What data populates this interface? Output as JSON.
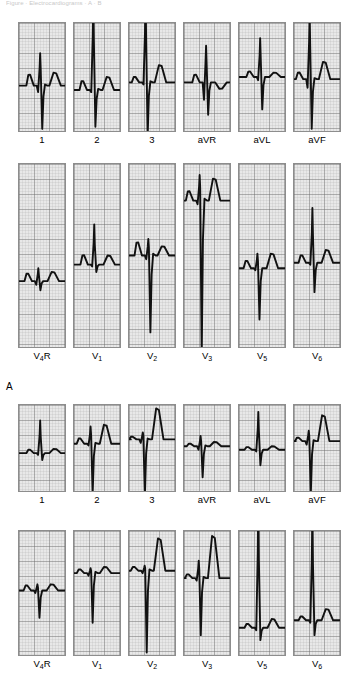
{
  "figure": {
    "cropped_caption": "Figure  ·  Electrocardiograms  ·  A  ·  B",
    "panels": [
      {
        "id": "A",
        "label": "A"
      },
      {
        "id": "B",
        "label": ""
      }
    ]
  },
  "grid": {
    "paper_color": "#e8e8e8",
    "fine_line_color": "#b3b3b3",
    "bold_line_color": "#6e6e6e",
    "border_color": "#8d8d8d",
    "trace_color": "#111111",
    "fine_spacing_px": 3,
    "bold_every": 5
  },
  "rows": [
    {
      "name": "panel-a-limb-leads",
      "panel": "A",
      "top": 22,
      "strip_width": 48,
      "strip_height": 110,
      "gap": 7,
      "left": 18,
      "leads": [
        {
          "label": "1",
          "label_html": "1",
          "name": "lead-i"
        },
        {
          "label": "2",
          "label_html": "2",
          "name": "lead-ii"
        },
        {
          "label": "3",
          "label_html": "3",
          "name": "lead-iii"
        },
        {
          "label": "aVR",
          "label_html": "aVR",
          "name": "lead-avr"
        },
        {
          "label": "aVL",
          "label_html": "aVL",
          "name": "lead-avl"
        },
        {
          "label": "aVF",
          "label_html": "aVF",
          "name": "lead-avf"
        }
      ]
    },
    {
      "name": "panel-a-precordial-leads",
      "panel": "A",
      "top": 163,
      "strip_width": 48,
      "strip_height": 185,
      "gap": 7,
      "left": 18,
      "leads": [
        {
          "label": "V4R",
          "label_html": "V<sub>4</sub>R",
          "name": "lead-v4r"
        },
        {
          "label": "V1",
          "label_html": "V<sub>1</sub>",
          "name": "lead-v1"
        },
        {
          "label": "V2",
          "label_html": "V<sub>2</sub>",
          "name": "lead-v2"
        },
        {
          "label": "V3",
          "label_html": "V<sub>3</sub>",
          "name": "lead-v3"
        },
        {
          "label": "V5",
          "label_html": "V<sub>5</sub>",
          "name": "lead-v5"
        },
        {
          "label": "V6",
          "label_html": "V<sub>6</sub>",
          "name": "lead-v6"
        }
      ]
    },
    {
      "name": "panel-b-limb-leads",
      "panel": "B",
      "top": 404,
      "strip_width": 48,
      "strip_height": 88,
      "gap": 7,
      "left": 18,
      "leads": [
        {
          "label": "1",
          "label_html": "1",
          "name": "lead-i"
        },
        {
          "label": "2",
          "label_html": "2",
          "name": "lead-ii"
        },
        {
          "label": "3",
          "label_html": "3",
          "name": "lead-iii"
        },
        {
          "label": "aVR",
          "label_html": "aVR",
          "name": "lead-avr"
        },
        {
          "label": "aVL",
          "label_html": "aVL",
          "name": "lead-avl"
        },
        {
          "label": "aVF",
          "label_html": "aVF",
          "name": "lead-avf"
        }
      ]
    },
    {
      "name": "panel-b-precordial-leads",
      "panel": "B",
      "top": 530,
      "strip_width": 48,
      "strip_height": 126,
      "gap": 7,
      "left": 18,
      "leads": [
        {
          "label": "V4R",
          "label_html": "V<sub>4</sub>R",
          "name": "lead-v4r"
        },
        {
          "label": "V1",
          "label_html": "V<sub>1</sub>",
          "name": "lead-v1"
        },
        {
          "label": "V2",
          "label_html": "V<sub>2</sub>",
          "name": "lead-v2"
        },
        {
          "label": "V3",
          "label_html": "V<sub>3</sub>",
          "name": "lead-v3"
        },
        {
          "label": "V5",
          "label_html": "V<sub>5</sub>",
          "name": "lead-v5"
        },
        {
          "label": "V6",
          "label_html": "V<sub>6</sub>",
          "name": "lead-v6"
        }
      ]
    }
  ],
  "panel_a_marker": {
    "text": "A",
    "x": 6,
    "y": 381
  },
  "traces": {
    "panel-a-limb-leads": [
      {
        "lead": "1",
        "baseline": 0.58,
        "p": 0.1,
        "q": -0.06,
        "r": 0.3,
        "s": -0.4,
        "t": 0.12,
        "qrs_x": 0.46
      },
      {
        "lead": "2",
        "baseline": 0.62,
        "p": 0.08,
        "q": -0.02,
        "r": 0.92,
        "s": -0.34,
        "t": 0.12,
        "qrs_x": 0.42
      },
      {
        "lead": "3",
        "baseline": 0.55,
        "p": 0.05,
        "q": -0.02,
        "r": 0.85,
        "s": -0.5,
        "t": 0.16,
        "qrs_x": 0.36
      },
      {
        "lead": "aVR",
        "baseline": 0.55,
        "p": 0.07,
        "q": -0.16,
        "r": 0.34,
        "s": -0.3,
        "t": -0.06,
        "qrs_x": 0.48
      },
      {
        "lead": "aVL",
        "baseline": 0.5,
        "p": 0.05,
        "q": -0.03,
        "r": 0.36,
        "s": -0.3,
        "t": 0.04,
        "qrs_x": 0.46
      },
      {
        "lead": "aVF",
        "baseline": 0.52,
        "p": 0.06,
        "q": -0.08,
        "r": 0.62,
        "s": -0.46,
        "t": 0.16,
        "qrs_x": 0.34
      }
    ],
    "panel-a-precordial-leads": [
      {
        "lead": "V4R",
        "baseline": 0.64,
        "p": 0.04,
        "q": -0.02,
        "r": 0.07,
        "s": -0.05,
        "t": 0.05,
        "qrs_x": 0.42
      },
      {
        "lead": "V1",
        "baseline": 0.55,
        "p": 0.05,
        "q": -0.01,
        "r": 0.22,
        "s": -0.04,
        "t": 0.05,
        "qrs_x": 0.44
      },
      {
        "lead": "V2",
        "baseline": 0.5,
        "p": 0.07,
        "q": -0.02,
        "r": 0.09,
        "s": -0.42,
        "t": 0.05,
        "qrs_x": 0.42
      },
      {
        "lead": "V3",
        "baseline": 0.2,
        "p": 0.05,
        "q": -0.02,
        "r": 0.14,
        "s": -0.85,
        "t": 0.12,
        "qrs_x": 0.34
      },
      {
        "lead": "V5",
        "baseline": 0.57,
        "p": 0.04,
        "q": -0.01,
        "r": 0.08,
        "s": -0.28,
        "t": 0.08,
        "qrs_x": 0.4
      },
      {
        "lead": "V6",
        "baseline": 0.54,
        "p": 0.04,
        "q": -0.01,
        "r": 0.3,
        "s": -0.16,
        "t": 0.07,
        "qrs_x": 0.4
      }
    ],
    "panel-b-limb-leads": [
      {
        "lead": "1",
        "baseline": 0.56,
        "p": 0.04,
        "q": -0.02,
        "r": 0.38,
        "s": -0.08,
        "t": 0.05,
        "qrs_x": 0.46
      },
      {
        "lead": "2",
        "baseline": 0.45,
        "p": 0.06,
        "q": -0.02,
        "r": 0.2,
        "s": -0.58,
        "t": 0.22,
        "qrs_x": 0.36
      },
      {
        "lead": "3",
        "baseline": 0.4,
        "p": 0.03,
        "q": -0.04,
        "r": 0.08,
        "s": -0.66,
        "t": 0.36,
        "qrs_x": 0.3
      },
      {
        "lead": "aVR",
        "baseline": 0.48,
        "p": 0.03,
        "q": -0.04,
        "r": 0.12,
        "s": -0.36,
        "t": 0.05,
        "qrs_x": 0.36
      },
      {
        "lead": "aVL",
        "baseline": 0.52,
        "p": 0.03,
        "q": -0.02,
        "r": 0.44,
        "s": -0.18,
        "t": 0.04,
        "qrs_x": 0.42
      },
      {
        "lead": "aVF",
        "baseline": 0.42,
        "p": 0.04,
        "q": -0.04,
        "r": 0.12,
        "s": -0.62,
        "t": 0.3,
        "qrs_x": 0.32
      }
    ],
    "panel-b-precordial-leads": [
      {
        "lead": "V4R",
        "baseline": 0.48,
        "p": 0.04,
        "q": -0.02,
        "r": 0.05,
        "s": -0.22,
        "t": 0.05,
        "qrs_x": 0.4
      },
      {
        "lead": "V1",
        "baseline": 0.34,
        "p": 0.03,
        "q": -0.02,
        "r": 0.04,
        "s": -0.4,
        "t": 0.05,
        "qrs_x": 0.36
      },
      {
        "lead": "V2",
        "baseline": 0.32,
        "p": 0.03,
        "q": -0.02,
        "r": 0.04,
        "s": -0.66,
        "t": 0.26,
        "qrs_x": 0.34
      },
      {
        "lead": "V3",
        "baseline": 0.38,
        "p": 0.03,
        "q": -0.02,
        "r": 0.14,
        "s": -0.46,
        "t": 0.34,
        "qrs_x": 0.32
      },
      {
        "lead": "V5",
        "baseline": 0.78,
        "p": 0.03,
        "q": -0.02,
        "r": 1.1,
        "s": -0.1,
        "t": 0.07,
        "qrs_x": 0.42
      },
      {
        "lead": "V6",
        "baseline": 0.72,
        "p": 0.03,
        "q": -0.02,
        "r": 0.92,
        "s": -0.12,
        "t": 0.09,
        "qrs_x": 0.4
      }
    ]
  }
}
